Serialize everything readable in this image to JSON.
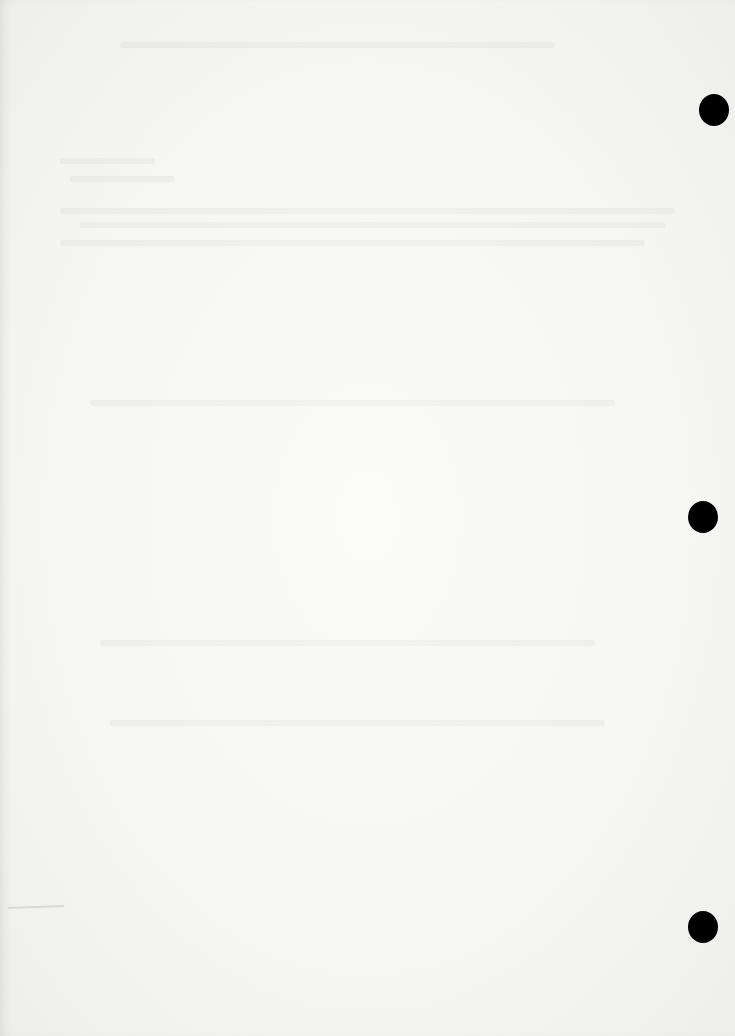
{
  "document": {
    "type": "scanned blank page",
    "content_text": "",
    "punch_holes": [
      {
        "x": 714,
        "y": 110
      },
      {
        "x": 703,
        "y": 517
      },
      {
        "x": 703,
        "y": 927
      }
    ],
    "colors": {
      "paper": "#f7f7f5",
      "hole": "#000000"
    }
  }
}
